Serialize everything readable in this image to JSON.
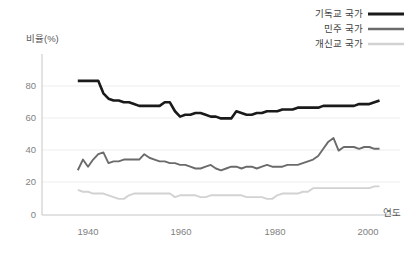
{
  "chart_data": {
    "type": "line",
    "title": "",
    "xlabel": "연도",
    "ylabel": "비율(%)",
    "xlim": [
      1935,
      2005
    ],
    "ylim": [
      0,
      90
    ],
    "xticks": [
      1940,
      1960,
      1980,
      2000
    ],
    "yticks": [
      0,
      20,
      40,
      60,
      80
    ],
    "grid": true,
    "legend_position": "top-right",
    "colors": {
      "christian": "#1a1a1a",
      "democratic": "#6b6b6b",
      "protestant": "#d2d2d2"
    },
    "x": [
      1942,
      1943,
      1944,
      1945,
      1946,
      1947,
      1948,
      1949,
      1950,
      1951,
      1952,
      1953,
      1954,
      1955,
      1956,
      1957,
      1958,
      1959,
      1960,
      1961,
      1962,
      1963,
      1964,
      1965,
      1966,
      1967,
      1968,
      1969,
      1970,
      1971,
      1972,
      1973,
      1974,
      1975,
      1976,
      1977,
      1978,
      1979,
      1980,
      1981,
      1982,
      1983,
      1984,
      1985,
      1986,
      1987,
      1988,
      1989,
      1990,
      1991,
      1992,
      1993,
      1994,
      1995,
      1996,
      1997,
      1998,
      1999,
      2000,
      2001
    ],
    "series": [
      {
        "name": "기독교 국가",
        "color": "#1a1a1a",
        "values": [
          75,
          75,
          75,
          75,
          75,
          68,
          65,
          64,
          64,
          63,
          63,
          62,
          61,
          61,
          61,
          61,
          61,
          63,
          63,
          58,
          55,
          56,
          56,
          57,
          57,
          56,
          55,
          55,
          54,
          54,
          54,
          58,
          57,
          56,
          56,
          57,
          57,
          58,
          58,
          58,
          59,
          59,
          59,
          60,
          60,
          60,
          60,
          60,
          61,
          61,
          61,
          61,
          61,
          61,
          61,
          62,
          62,
          62,
          63,
          64
        ]
      },
      {
        "name": "민주 국가",
        "color": "#6b6b6b",
        "values": [
          25,
          31,
          27,
          31,
          34,
          35,
          29,
          30,
          30,
          31,
          31,
          31,
          31,
          34,
          32,
          31,
          30,
          30,
          29,
          29,
          28,
          28,
          27,
          26,
          26,
          27,
          28,
          26,
          25,
          26,
          27,
          27,
          26,
          27,
          27,
          26,
          27,
          28,
          27,
          27,
          27,
          28,
          28,
          28,
          29,
          30,
          31,
          33,
          37,
          41,
          43,
          36,
          38,
          38,
          38,
          37,
          38,
          38,
          37,
          37
        ]
      },
      {
        "name": "개신교 국가",
        "color": "#d2d2d2",
        "values": [
          14,
          13,
          13,
          12,
          12,
          12,
          11,
          10,
          9,
          9,
          11,
          12,
          12,
          12,
          12,
          12,
          12,
          12,
          12,
          10,
          11,
          11,
          11,
          11,
          10,
          10,
          11,
          11,
          11,
          11,
          11,
          11,
          11,
          10,
          10,
          10,
          10,
          9,
          9,
          11,
          12,
          12,
          12,
          12,
          13,
          13,
          15,
          15,
          15,
          15,
          15,
          15,
          15,
          15,
          15,
          15,
          15,
          15,
          16,
          16
        ]
      }
    ]
  },
  "legend": {
    "items": [
      {
        "label": "기독교 국가"
      },
      {
        "label": "민주 국가"
      },
      {
        "label": "개신교 국가"
      }
    ]
  },
  "axis": {
    "y_title": "비율(%)",
    "x_title": "연도",
    "y_tick_labels": [
      "80",
      "60",
      "40",
      "20",
      "0"
    ],
    "x_tick_labels": [
      "1940",
      "1960",
      "1980",
      "2000"
    ]
  }
}
